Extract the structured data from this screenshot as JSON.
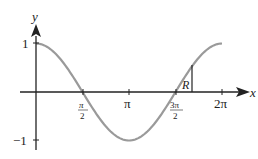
{
  "figure": {
    "axes": {
      "x_label": "x",
      "y_label": "y",
      "y_ticks": [
        {
          "value": 1,
          "label": "1"
        },
        {
          "value": -1,
          "label": "−1"
        }
      ],
      "x_ticks": [
        {
          "value": "pi/2",
          "num": "π",
          "den": "2"
        },
        {
          "value": "pi",
          "label": "π"
        },
        {
          "value": "3pi/2",
          "num": "3π",
          "den": "2"
        },
        {
          "value": "2pi",
          "label": "2π"
        }
      ]
    },
    "curve": {
      "function": "y = cos x",
      "domain": "0 to 2π",
      "color": "#999999"
    },
    "region_label": "R",
    "colors": {
      "axis": "#222222",
      "curve": "#9a9a9a"
    }
  }
}
